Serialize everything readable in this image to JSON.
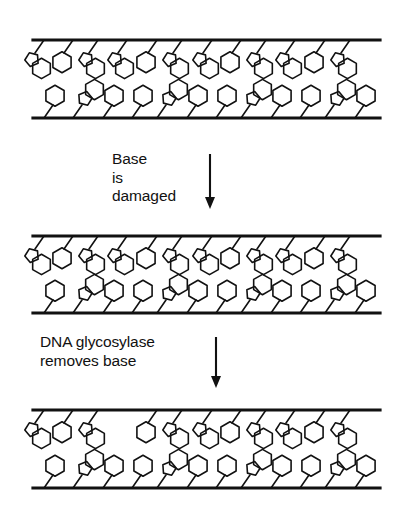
{
  "figure": {
    "background_color": "#ffffff",
    "line_color": "#111111",
    "width": 408,
    "height": 510
  },
  "steps": [
    {
      "id": "step-base-damaged",
      "lines": [
        "Base",
        "is",
        "damaged"
      ],
      "arrow": "down-arrow",
      "x": 112,
      "y": 150
    },
    {
      "id": "step-glycosylase-removes-base",
      "lines": [
        "DNA glycosylase",
        "removes base"
      ],
      "arrow": "down-arrow",
      "x": 40,
      "y": 333
    }
  ],
  "panels": [
    {
      "id": "dna-duplex-intact",
      "caption_state": "intact duplex",
      "y": 30,
      "top_backbone_y": 40,
      "bottom_backbone_y": 118,
      "backbone_x_start": 33,
      "backbone_x_end": 380,
      "top_bases": [
        {
          "x": 44,
          "type": "purine"
        },
        {
          "x": 73,
          "type": "pyrimidine"
        },
        {
          "x": 98,
          "type": "purine"
        },
        {
          "x": 127,
          "type": "purine"
        },
        {
          "x": 157,
          "type": "pyrimidine"
        },
        {
          "x": 182,
          "type": "purine"
        },
        {
          "x": 212,
          "type": "purine"
        },
        {
          "x": 241,
          "type": "pyrimidine"
        },
        {
          "x": 266,
          "type": "purine"
        },
        {
          "x": 295,
          "type": "purine"
        },
        {
          "x": 325,
          "type": "pyrimidine"
        },
        {
          "x": 350,
          "type": "purine"
        }
      ],
      "bottom_bases": [
        {
          "x": 44,
          "type": "pyrimidine"
        },
        {
          "x": 73,
          "type": "purine"
        },
        {
          "x": 103,
          "type": "pyrimidine"
        },
        {
          "x": 132,
          "type": "pyrimidine"
        },
        {
          "x": 157,
          "type": "purine"
        },
        {
          "x": 187,
          "type": "pyrimidine"
        },
        {
          "x": 216,
          "type": "pyrimidine"
        },
        {
          "x": 241,
          "type": "purine"
        },
        {
          "x": 271,
          "type": "pyrimidine"
        },
        {
          "x": 300,
          "type": "pyrimidine"
        },
        {
          "x": 325,
          "type": "purine"
        },
        {
          "x": 355,
          "type": "pyrimidine"
        }
      ]
    },
    {
      "id": "dna-duplex-damaged",
      "caption_state": "duplex with damaged base",
      "y": 226,
      "top_backbone_y": 236,
      "bottom_backbone_y": 313,
      "backbone_x_start": 33,
      "backbone_x_end": 380,
      "top_bases": [
        {
          "x": 44,
          "type": "purine"
        },
        {
          "x": 73,
          "type": "pyrimidine"
        },
        {
          "x": 98,
          "type": "purine"
        },
        {
          "x": 127,
          "type": "purine"
        },
        {
          "x": 157,
          "type": "pyrimidine"
        },
        {
          "x": 182,
          "type": "purine"
        },
        {
          "x": 212,
          "type": "purine"
        },
        {
          "x": 241,
          "type": "pyrimidine"
        },
        {
          "x": 266,
          "type": "purine"
        },
        {
          "x": 295,
          "type": "purine"
        },
        {
          "x": 325,
          "type": "pyrimidine"
        },
        {
          "x": 350,
          "type": "purine"
        }
      ],
      "bottom_bases": [
        {
          "x": 44,
          "type": "pyrimidine"
        },
        {
          "x": 73,
          "type": "purine"
        },
        {
          "x": 103,
          "type": "pyrimidine"
        },
        {
          "x": 132,
          "type": "pyrimidine"
        },
        {
          "x": 157,
          "type": "purine"
        },
        {
          "x": 187,
          "type": "pyrimidine"
        },
        {
          "x": 216,
          "type": "pyrimidine"
        },
        {
          "x": 241,
          "type": "purine"
        },
        {
          "x": 271,
          "type": "pyrimidine"
        },
        {
          "x": 300,
          "type": "pyrimidine"
        },
        {
          "x": 325,
          "type": "purine"
        },
        {
          "x": 355,
          "type": "pyrimidine"
        }
      ]
    },
    {
      "id": "dna-duplex-base-removed",
      "caption_state": "duplex with base removed (abasic site)",
      "y": 400,
      "top_backbone_y": 410,
      "bottom_backbone_y": 488,
      "backbone_x_start": 33,
      "backbone_x_end": 380,
      "missing_top_base_index": 3,
      "top_bases": [
        {
          "x": 44,
          "type": "purine"
        },
        {
          "x": 73,
          "type": "pyrimidine"
        },
        {
          "x": 98,
          "type": "purine"
        },
        {
          "x": 127,
          "type": "gap"
        },
        {
          "x": 157,
          "type": "pyrimidine"
        },
        {
          "x": 182,
          "type": "purine"
        },
        {
          "x": 212,
          "type": "purine"
        },
        {
          "x": 241,
          "type": "pyrimidine"
        },
        {
          "x": 266,
          "type": "purine"
        },
        {
          "x": 295,
          "type": "purine"
        },
        {
          "x": 325,
          "type": "pyrimidine"
        },
        {
          "x": 350,
          "type": "purine"
        }
      ],
      "bottom_bases": [
        {
          "x": 44,
          "type": "pyrimidine"
        },
        {
          "x": 73,
          "type": "purine"
        },
        {
          "x": 103,
          "type": "pyrimidine"
        },
        {
          "x": 132,
          "type": "pyrimidine"
        },
        {
          "x": 157,
          "type": "purine"
        },
        {
          "x": 187,
          "type": "pyrimidine"
        },
        {
          "x": 216,
          "type": "pyrimidine"
        },
        {
          "x": 241,
          "type": "purine"
        },
        {
          "x": 271,
          "type": "pyrimidine"
        },
        {
          "x": 300,
          "type": "pyrimidine"
        },
        {
          "x": 325,
          "type": "purine"
        },
        {
          "x": 355,
          "type": "pyrimidine"
        }
      ]
    }
  ]
}
